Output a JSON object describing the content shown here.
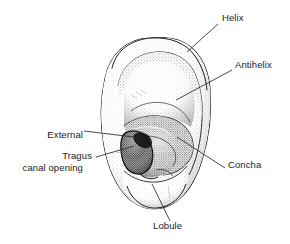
{
  "figure": {
    "style": "black-and-white stippled line drawing",
    "background_color": "#ffffff",
    "ink_color": "#1a1a1a",
    "leader_line_color": "#2b2b2b",
    "partial_caption": "."
  },
  "labels": [
    {
      "id": "helix",
      "text": "Helix",
      "lines": [
        "Helix"
      ],
      "side": "right",
      "text_x": 222,
      "text_y": 17,
      "leader": {
        "x1": 218,
        "y1": 24,
        "x2": 187,
        "y2": 52
      }
    },
    {
      "id": "antihelix",
      "text": "Antihelix",
      "lines": [
        "Antihelix"
      ],
      "side": "right",
      "text_x": 235,
      "text_y": 64,
      "leader": {
        "x1": 232,
        "y1": 70,
        "x2": 176,
        "y2": 100
      }
    },
    {
      "id": "external-canal-opening",
      "text": "External canal opening",
      "lines": [
        "External",
        "canal opening"
      ],
      "side": "left",
      "text_x": 13,
      "text_y": 112,
      "leader": {
        "x1": 84,
        "y1": 131,
        "x2": 134,
        "y2": 137
      }
    },
    {
      "id": "tragus",
      "text": "Tragus",
      "lines": [
        "Tragus"
      ],
      "side": "left",
      "text_x": 55,
      "text_y": 154,
      "leader": {
        "x1": 96,
        "y1": 157,
        "x2": 134,
        "y2": 146
      }
    },
    {
      "id": "concha",
      "text": "Concha",
      "lines": [
        "Concha"
      ],
      "side": "right",
      "text_x": 228,
      "text_y": 163,
      "leader": {
        "x1": 225,
        "y1": 168,
        "x2": 177,
        "y2": 137
      }
    },
    {
      "id": "lobule",
      "text": "Lobule",
      "lines": [
        "Lobule"
      ],
      "side": "right",
      "text_x": 153,
      "text_y": 224,
      "leader": {
        "x1": 170,
        "y1": 221,
        "x2": 152,
        "y2": 184
      }
    }
  ]
}
